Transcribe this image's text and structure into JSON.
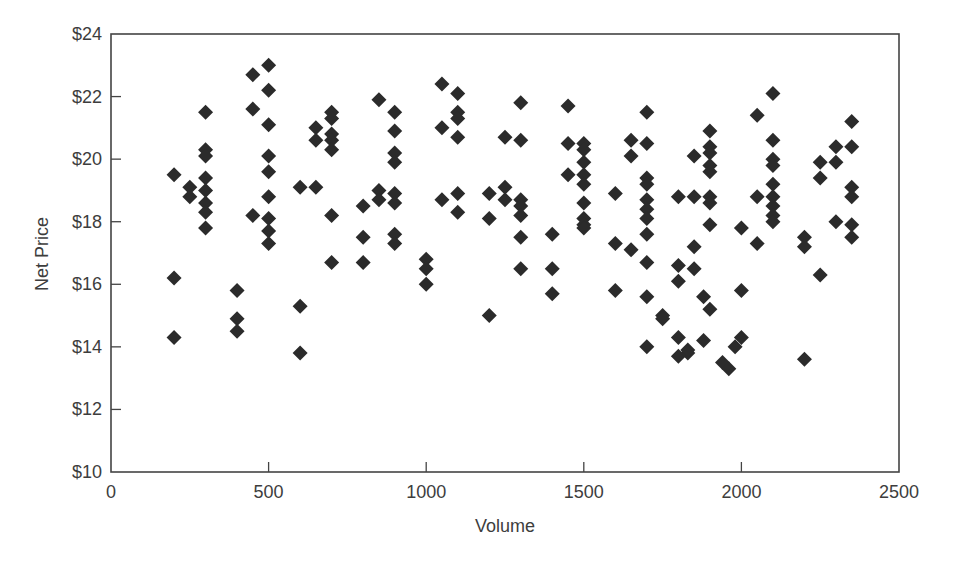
{
  "chart_data": {
    "type": "scatter",
    "title": "",
    "xlabel": "Volume",
    "ylabel": "Net Price",
    "xlim": [
      0,
      2500
    ],
    "ylim": [
      10,
      24
    ],
    "x_ticks": [
      0,
      500,
      1000,
      1500,
      2000,
      2500
    ],
    "x_tick_labels": [
      "0",
      "500",
      "1000",
      "1500",
      "2000",
      "2500"
    ],
    "y_ticks": [
      10,
      12,
      14,
      16,
      18,
      20,
      22,
      24
    ],
    "y_tick_labels": [
      "$10",
      "$12",
      "$14",
      "$16",
      "$18",
      "$20",
      "$22",
      "$24"
    ],
    "grid": false,
    "legend": null,
    "marker": "diamond",
    "marker_color": "#2b2b2b",
    "series": [
      {
        "name": "Transactions",
        "points": [
          [
            200,
            19.5
          ],
          [
            200,
            16.2
          ],
          [
            200,
            14.3
          ],
          [
            250,
            19.1
          ],
          [
            250,
            18.8
          ],
          [
            300,
            21.5
          ],
          [
            300,
            20.3
          ],
          [
            300,
            20.1
          ],
          [
            300,
            19.4
          ],
          [
            300,
            19.0
          ],
          [
            300,
            18.6
          ],
          [
            300,
            18.3
          ],
          [
            300,
            17.8
          ],
          [
            400,
            15.8
          ],
          [
            400,
            14.9
          ],
          [
            400,
            14.5
          ],
          [
            450,
            22.7
          ],
          [
            450,
            21.6
          ],
          [
            450,
            18.2
          ],
          [
            500,
            23.0
          ],
          [
            500,
            22.2
          ],
          [
            500,
            21.1
          ],
          [
            500,
            20.1
          ],
          [
            500,
            19.6
          ],
          [
            500,
            18.8
          ],
          [
            500,
            18.1
          ],
          [
            500,
            17.7
          ],
          [
            500,
            17.3
          ],
          [
            600,
            19.1
          ],
          [
            600,
            15.3
          ],
          [
            600,
            13.8
          ],
          [
            650,
            21.0
          ],
          [
            650,
            20.6
          ],
          [
            650,
            19.1
          ],
          [
            700,
            21.5
          ],
          [
            700,
            21.3
          ],
          [
            700,
            20.8
          ],
          [
            700,
            20.6
          ],
          [
            700,
            20.3
          ],
          [
            700,
            18.2
          ],
          [
            700,
            16.7
          ],
          [
            800,
            18.5
          ],
          [
            800,
            17.5
          ],
          [
            800,
            16.7
          ],
          [
            850,
            21.9
          ],
          [
            850,
            19.0
          ],
          [
            850,
            18.7
          ],
          [
            900,
            21.5
          ],
          [
            900,
            20.9
          ],
          [
            900,
            20.2
          ],
          [
            900,
            19.9
          ],
          [
            900,
            18.9
          ],
          [
            900,
            18.6
          ],
          [
            900,
            17.6
          ],
          [
            900,
            17.3
          ],
          [
            1000,
            16.8
          ],
          [
            1000,
            16.5
          ],
          [
            1000,
            16.0
          ],
          [
            1050,
            22.4
          ],
          [
            1050,
            21.0
          ],
          [
            1050,
            18.7
          ],
          [
            1100,
            22.1
          ],
          [
            1100,
            21.5
          ],
          [
            1100,
            21.3
          ],
          [
            1100,
            20.7
          ],
          [
            1100,
            18.9
          ],
          [
            1100,
            18.3
          ],
          [
            1200,
            18.9
          ],
          [
            1200,
            18.1
          ],
          [
            1200,
            15.0
          ],
          [
            1250,
            20.7
          ],
          [
            1250,
            19.1
          ],
          [
            1250,
            18.7
          ],
          [
            1300,
            21.8
          ],
          [
            1300,
            20.6
          ],
          [
            1300,
            18.7
          ],
          [
            1300,
            18.5
          ],
          [
            1300,
            18.2
          ],
          [
            1300,
            17.5
          ],
          [
            1300,
            16.5
          ],
          [
            1400,
            17.6
          ],
          [
            1400,
            16.5
          ],
          [
            1400,
            15.7
          ],
          [
            1450,
            21.7
          ],
          [
            1450,
            20.5
          ],
          [
            1450,
            19.5
          ],
          [
            1500,
            20.5
          ],
          [
            1500,
            20.3
          ],
          [
            1500,
            19.9
          ],
          [
            1500,
            19.5
          ],
          [
            1500,
            19.2
          ],
          [
            1500,
            18.6
          ],
          [
            1500,
            18.1
          ],
          [
            1500,
            17.9
          ],
          [
            1500,
            17.8
          ],
          [
            1600,
            18.9
          ],
          [
            1600,
            17.3
          ],
          [
            1600,
            15.8
          ],
          [
            1650,
            20.6
          ],
          [
            1650,
            20.1
          ],
          [
            1650,
            17.1
          ],
          [
            1700,
            21.5
          ],
          [
            1700,
            20.5
          ],
          [
            1700,
            19.4
          ],
          [
            1700,
            19.2
          ],
          [
            1700,
            18.7
          ],
          [
            1700,
            18.4
          ],
          [
            1700,
            18.1
          ],
          [
            1700,
            17.6
          ],
          [
            1700,
            16.7
          ],
          [
            1700,
            15.6
          ],
          [
            1700,
            14.0
          ],
          [
            1750,
            15.0
          ],
          [
            1750,
            14.9
          ],
          [
            1800,
            18.8
          ],
          [
            1800,
            16.6
          ],
          [
            1800,
            16.1
          ],
          [
            1800,
            14.3
          ],
          [
            1800,
            13.7
          ],
          [
            1830,
            13.8
          ],
          [
            1830,
            13.9
          ],
          [
            1850,
            20.1
          ],
          [
            1850,
            18.8
          ],
          [
            1850,
            17.2
          ],
          [
            1850,
            16.5
          ],
          [
            1880,
            15.6
          ],
          [
            1880,
            14.2
          ],
          [
            1900,
            20.9
          ],
          [
            1900,
            20.4
          ],
          [
            1900,
            20.2
          ],
          [
            1900,
            19.8
          ],
          [
            1900,
            19.6
          ],
          [
            1900,
            18.8
          ],
          [
            1900,
            18.6
          ],
          [
            1900,
            17.9
          ],
          [
            1900,
            15.2
          ],
          [
            1940,
            13.5
          ],
          [
            1960,
            13.3
          ],
          [
            1980,
            14.0
          ],
          [
            2000,
            17.8
          ],
          [
            2000,
            15.8
          ],
          [
            2000,
            14.3
          ],
          [
            2050,
            21.4
          ],
          [
            2050,
            18.8
          ],
          [
            2050,
            17.3
          ],
          [
            2100,
            22.1
          ],
          [
            2100,
            20.6
          ],
          [
            2100,
            20.0
          ],
          [
            2100,
            19.8
          ],
          [
            2100,
            19.2
          ],
          [
            2100,
            18.8
          ],
          [
            2100,
            18.5
          ],
          [
            2100,
            18.2
          ],
          [
            2100,
            18.0
          ],
          [
            2200,
            17.5
          ],
          [
            2200,
            17.2
          ],
          [
            2200,
            13.6
          ],
          [
            2250,
            19.9
          ],
          [
            2250,
            19.4
          ],
          [
            2250,
            16.3
          ],
          [
            2300,
            20.4
          ],
          [
            2300,
            19.9
          ],
          [
            2300,
            18.0
          ],
          [
            2350,
            21.2
          ],
          [
            2350,
            20.4
          ],
          [
            2350,
            19.1
          ],
          [
            2350,
            18.8
          ],
          [
            2350,
            17.9
          ],
          [
            2350,
            17.5
          ]
        ]
      }
    ]
  },
  "axes": {
    "x_title": "Volume",
    "y_title": "Net Price"
  }
}
